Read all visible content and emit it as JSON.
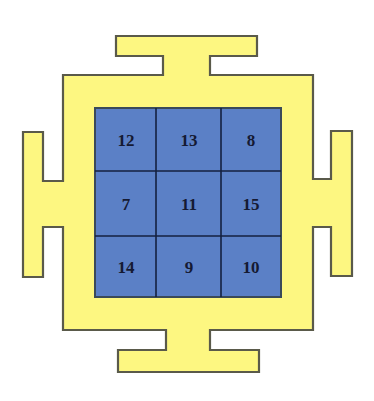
{
  "diagram": {
    "type": "magic-square-yantra",
    "colors": {
      "frame_fill": "#fdf781",
      "frame_border": "#5a5a4a",
      "grid_fill": "#5b80c6",
      "grid_lines": "#14203f",
      "text": "#151a33"
    },
    "grid": {
      "rows": [
        [
          "12",
          "13",
          "8"
        ],
        [
          "7",
          "11",
          "15"
        ],
        [
          "14",
          "9",
          "10"
        ]
      ]
    }
  }
}
